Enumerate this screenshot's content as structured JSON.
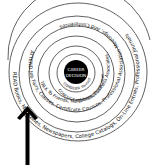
{
  "diagram": {
    "center": {
      "line1": "CAREER",
      "line2": "DECISION"
    },
    "rings": [
      {
        "id": "consider",
        "text": "CONSIDER Yourself"
      },
      {
        "id": "conduct",
        "text": "CONDUCT Information Interviews"
      },
      {
        "id": "talk",
        "text": "TALK To Friends, Neighbors, Business Associates, Anyone"
      },
      {
        "id": "attend",
        "text": "ATTEND Job Fairs, Classes, Certificate Courses, Professional Association Meetings, And Conferences"
      },
      {
        "id": "read",
        "text": "READ Books, Magazines, Newspapers, College Catalogs, On-Line Entries, Professional Journals"
      }
    ],
    "arrow": {
      "direction": "up",
      "color": "#000000"
    },
    "colors": {
      "ink": "#111111",
      "center_fill": "#000000",
      "background": "#ffffff"
    }
  }
}
